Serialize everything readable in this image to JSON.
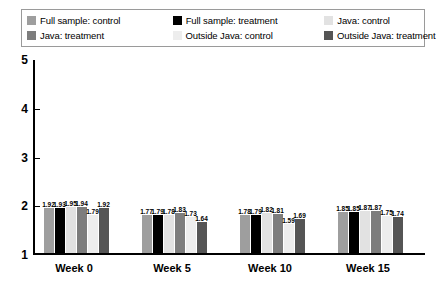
{
  "legend": {
    "items": [
      {
        "label": "Full sample: control",
        "color": "#9e9e9e",
        "swatch_name": "legend-swatch-full-sample-control"
      },
      {
        "label": "Full sample: treatment",
        "color": "#000000",
        "swatch_name": "legend-swatch-full-sample-treatment"
      },
      {
        "label": "Java: control",
        "color": "#e2e2e2",
        "swatch_name": "legend-swatch-java-control"
      },
      {
        "label": "Java: treatment",
        "color": "#7d7d7d",
        "swatch_name": "legend-swatch-java-treatment"
      },
      {
        "label": "Outside Java: control",
        "color": "#ededed",
        "swatch_name": "legend-swatch-outside-java-control"
      },
      {
        "label": "Outside Java: treatment",
        "color": "#555555",
        "swatch_name": "legend-swatch-outside-java-treatment"
      }
    ]
  },
  "chart_data": {
    "type": "bar",
    "title": "",
    "xlabel": "",
    "ylabel": "",
    "ylim": [
      1,
      5
    ],
    "yticks": [
      1,
      2,
      3,
      4,
      5
    ],
    "grid": false,
    "legend_position": "top",
    "categories": [
      "Week 0",
      "Week 5",
      "Week 10",
      "Week 15"
    ],
    "series": [
      {
        "name": "Full sample: control",
        "color": "#9e9e9e",
        "values": [
          1.92,
          1.77,
          1.78,
          1.85
        ]
      },
      {
        "name": "Full sample: treatment",
        "color": "#000000",
        "values": [
          1.93,
          1.79,
          1.79,
          1.85
        ]
      },
      {
        "name": "Java: control",
        "color": "#e2e2e2",
        "values": [
          1.95,
          1.78,
          1.82,
          1.87
        ]
      },
      {
        "name": "Java: treatment",
        "color": "#7d7d7d",
        "values": [
          1.94,
          1.83,
          1.81,
          1.87
        ]
      },
      {
        "name": "Outside Java: control",
        "color": "#ededed",
        "values": [
          1.79,
          1.73,
          1.59,
          1.75
        ]
      },
      {
        "name": "Outside Java: treatment",
        "color": "#555555",
        "values": [
          1.92,
          1.64,
          1.69,
          1.74
        ]
      }
    ]
  }
}
